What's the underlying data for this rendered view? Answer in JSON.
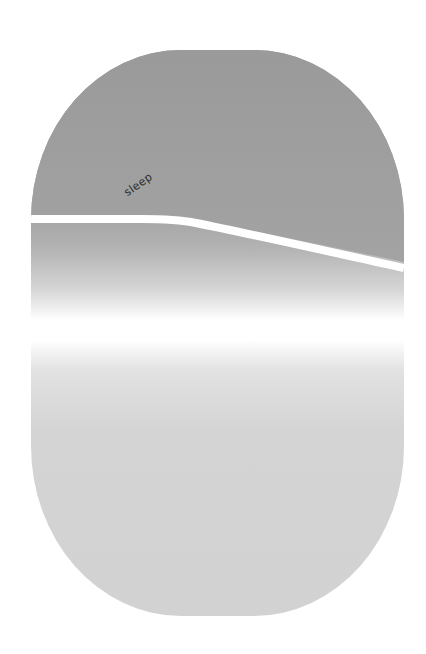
{
  "capsule": {
    "label": "sleep",
    "colors": {
      "top": "#9a9a9a",
      "bottom": "#d2d2d2",
      "line": "#ffffff",
      "glow": "#ffffff",
      "background": "#ffffff",
      "label": "#2a2a2a"
    }
  }
}
